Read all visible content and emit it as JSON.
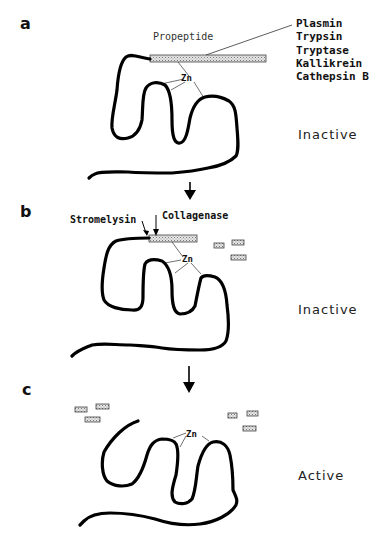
{
  "figure": {
    "panels": [
      {
        "letter": "a",
        "propeptide_label": "Propeptide",
        "zn_label": "Zn",
        "activators": [
          "Plasmin",
          "Trypsin",
          "Tryptase",
          "Kallikrein",
          "Cathepsin B"
        ],
        "state": "Inactive"
      },
      {
        "letter": "b",
        "cleavage_enzymes": [
          "Stromelysin",
          "Collagenase"
        ],
        "zn_label": "Zn",
        "state": "Inactive"
      },
      {
        "letter": "c",
        "zn_label": "Zn",
        "state": "Active"
      }
    ],
    "colors": {
      "chain": "#000000",
      "propeptide_fill": "#d8d8d8",
      "text": "#111111"
    }
  }
}
